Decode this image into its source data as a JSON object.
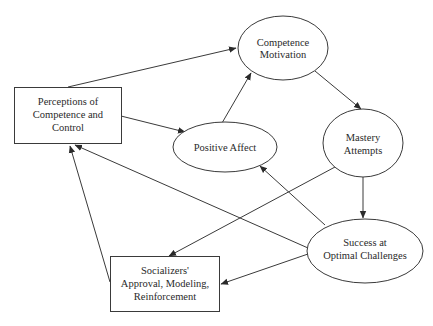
{
  "diagram": {
    "type": "flow-model",
    "nodes": {
      "perceptions": {
        "shape": "rect",
        "lines": [
          "Perceptions of",
          "Competence and",
          "Control"
        ]
      },
      "competence_motivation": {
        "shape": "ellipse",
        "lines": [
          "Competence",
          "Motivation"
        ]
      },
      "positive_affect": {
        "shape": "ellipse",
        "lines": [
          "Positive Affect"
        ]
      },
      "mastery_attempts": {
        "shape": "ellipse",
        "lines": [
          "Mastery",
          "Attempts"
        ]
      },
      "success": {
        "shape": "ellipse",
        "lines": [
          "Success at",
          "Optimal Challenges"
        ]
      },
      "socializers": {
        "shape": "rect",
        "lines": [
          "Socializers'",
          "Approval, Modeling,",
          "Reinforcement"
        ]
      }
    },
    "edges": [
      {
        "from": "perceptions",
        "to": "competence_motivation"
      },
      {
        "from": "perceptions",
        "to": "positive_affect"
      },
      {
        "from": "positive_affect",
        "to": "competence_motivation"
      },
      {
        "from": "competence_motivation",
        "to": "mastery_attempts"
      },
      {
        "from": "mastery_attempts",
        "to": "success"
      },
      {
        "from": "mastery_attempts",
        "to": "socializers"
      },
      {
        "from": "success",
        "to": "positive_affect"
      },
      {
        "from": "success",
        "to": "perceptions"
      },
      {
        "from": "success",
        "to": "socializers"
      },
      {
        "from": "socializers",
        "to": "perceptions"
      }
    ]
  }
}
